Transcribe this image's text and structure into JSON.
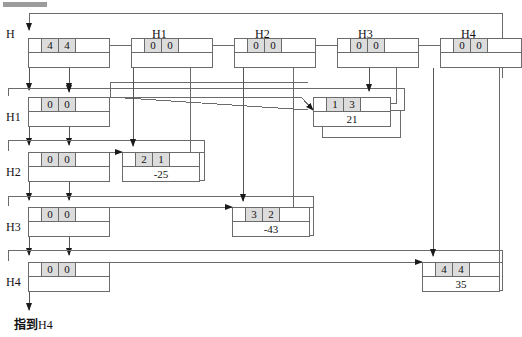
{
  "diagram": {
    "title_marker": "",
    "bottom_label_cn": "指到",
    "bottom_label_en": "H4",
    "colors": {
      "line": "#6b6b6b",
      "arrow": "#1a1a1a",
      "cell_shade": "#dcdcdc",
      "background": "#ffffff"
    }
  },
  "header_row": {
    "caption_H": "H",
    "nodes": [
      {
        "caption": "H",
        "ptr": "",
        "a": "4",
        "b": "4",
        "tail": "",
        "below": ""
      },
      {
        "caption": "H1",
        "ptr": "",
        "a": "0",
        "b": "0",
        "tail": "",
        "below": ""
      },
      {
        "caption": "H2",
        "ptr": "",
        "a": "0",
        "b": "0",
        "tail": "",
        "below": ""
      },
      {
        "caption": "H3",
        "ptr": "",
        "a": "0",
        "b": "0",
        "tail": "",
        "below": ""
      },
      {
        "caption": "H4",
        "ptr": "",
        "a": "0",
        "b": "0",
        "tail": "",
        "below": ""
      }
    ]
  },
  "left_column": {
    "nodes": [
      {
        "label": "H1",
        "a": "0",
        "b": "0"
      },
      {
        "label": "H2",
        "a": "0",
        "b": "0"
      },
      {
        "label": "H3",
        "a": "0",
        "b": "0"
      },
      {
        "label": "H4",
        "a": "0",
        "b": "0"
      }
    ]
  },
  "data_nodes": [
    {
      "row": "H1",
      "i": "1",
      "j": "3",
      "value": "21"
    },
    {
      "row": "H2",
      "i": "2",
      "j": "1",
      "value": "-25"
    },
    {
      "row": "H3",
      "i": "3",
      "j": "2",
      "value": "-43"
    },
    {
      "row": "H4",
      "i": "4",
      "j": "4",
      "value": "35"
    }
  ]
}
